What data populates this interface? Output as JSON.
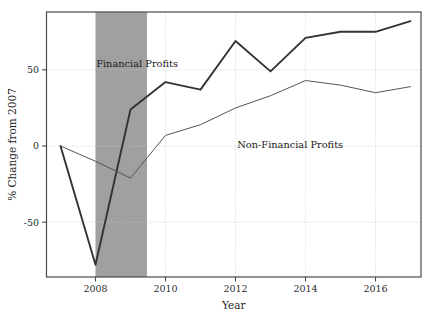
{
  "chart_data": {
    "type": "line",
    "title": "",
    "xlabel": "Year",
    "ylabel": "% Change from 2007",
    "x": [
      2007,
      2008,
      2009,
      2010,
      2011,
      2012,
      2013,
      2014,
      2015,
      2016,
      2017
    ],
    "xlim": [
      2006.6,
      2017.3
    ],
    "ylim": [
      -86,
      88
    ],
    "xticks": [
      2008,
      2010,
      2012,
      2014,
      2016
    ],
    "xtick_labels": [
      "2008",
      "2010",
      "2012",
      "2014",
      "2016"
    ],
    "yticks": [
      -50,
      0,
      50
    ],
    "ytick_labels": [
      "-50",
      "0",
      "50"
    ],
    "grid": true,
    "grid_style": "dotted",
    "legend_position": "inline-annotations",
    "series": [
      {
        "name": "Financial Profits",
        "color": "#333333",
        "line_width": 1.9,
        "values": [
          0,
          -78,
          24,
          42,
          37,
          69,
          49,
          71,
          75,
          75,
          82
        ]
      },
      {
        "name": "Non-Financial Profits",
        "color": "#555555",
        "line_width": 1.0,
        "values": [
          0,
          -10,
          -21,
          7,
          14,
          25,
          33,
          43,
          40,
          35,
          39
        ]
      }
    ],
    "annotations": [
      {
        "text": "Financial Profits",
        "x": 2008.02,
        "y": 52,
        "anchor": "start"
      },
      {
        "text": "Non-Financial Profits",
        "x": 2012.05,
        "y": -1,
        "anchor": "start"
      }
    ],
    "shaded_regions": [
      {
        "name": "recession-band",
        "x_start": 2008.0,
        "x_end": 2009.47,
        "color": "#a0a0a0"
      }
    ],
    "colors": {
      "axis": "#4a4a4a",
      "grid": "#c9c9c9",
      "background": "#ffffff",
      "text": "#1f1f1f"
    }
  }
}
